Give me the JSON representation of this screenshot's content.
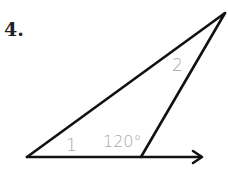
{
  "problem": {
    "number": "4."
  },
  "diagram": {
    "type": "triangle-exterior-angle",
    "vertices": {
      "left": [
        27,
        157
      ],
      "bottom": [
        141,
        157
      ],
      "apex": [
        225,
        13
      ]
    },
    "ray_end": [
      203,
      157
    ],
    "labels": {
      "angle_1": "1",
      "angle_2": "2",
      "exterior_angle": "120°"
    },
    "colors": {
      "lines": "#111111",
      "labels": "#a8a8a8"
    }
  }
}
